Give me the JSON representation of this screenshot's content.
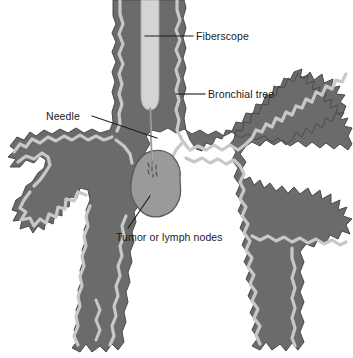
{
  "figure": {
    "width": 353,
    "height": 358,
    "background_color": "#ffffff"
  },
  "colors": {
    "airway_wall": "#6b6b6b",
    "airway_lining": "#c8c8c8",
    "fiberscope": "#d4d4d4",
    "tumor_fill": "#9a9a9a",
    "tumor_outline": "#5a5a5a",
    "needle": "#8a8a8a",
    "leader_line": "#1a1a1a",
    "label_text": "#1a1a1a",
    "outline": "#4a4a4a"
  },
  "labels": {
    "fiberscope": "Fiberscope",
    "bronchial_tree": "Bronchial tree",
    "needle": "Needle",
    "tumor": "Tumor or lymph nodes"
  },
  "parts": {
    "fiberscope": "fiberscope-tube",
    "trachea": "trachea",
    "carina": "carina",
    "left_main_bronchus": "left-main-bronchus",
    "right_main_bronchus": "right-main-bronchus",
    "needle": "aspiration-needle",
    "tumor": "tumor-mass"
  },
  "leader_lines": {
    "fiberscope": {
      "x1": 145,
      "y1": 36,
      "x2": 193,
      "y2": 36
    },
    "bronchial_tree": {
      "x1": 176,
      "y1": 94,
      "x2": 205,
      "y2": 94
    },
    "needle": {
      "x1": 92,
      "y1": 116,
      "x2": 157,
      "y2": 138
    },
    "tumor": {
      "x1": 128,
      "y1": 228,
      "x2": 150,
      "y2": 196
    }
  }
}
